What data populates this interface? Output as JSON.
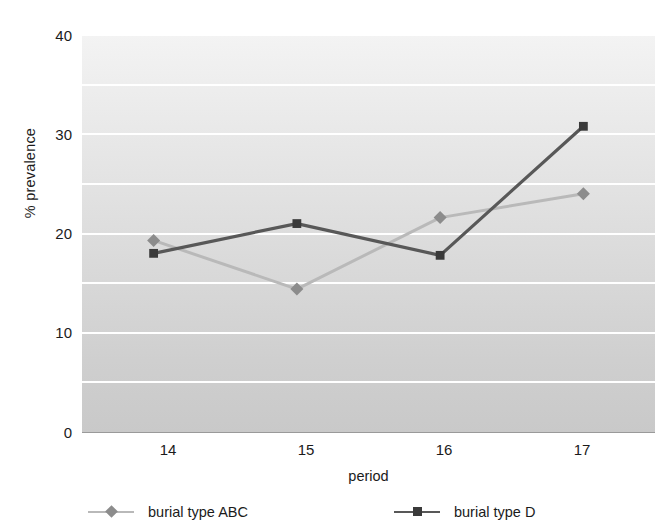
{
  "chart_data": {
    "type": "line",
    "title": "",
    "xlabel": "period",
    "ylabel": "% prevalence",
    "categories": [
      "14",
      "15",
      "16",
      "17"
    ],
    "x": [
      14,
      15,
      16,
      17
    ],
    "xlim": [
      13.5,
      17.5
    ],
    "ylim": [
      0,
      40
    ],
    "yticks": [
      0,
      10,
      20,
      30,
      40
    ],
    "ytick_labels": [
      "0",
      "10",
      "20",
      "30",
      "40"
    ],
    "gridlines_minor": [
      5,
      15,
      25,
      35
    ],
    "grid": true,
    "grid_color": "#ffffff",
    "legend_position": "below-axis",
    "plot_background": "gradient light-gray top to medium-gray bottom",
    "series": [
      {
        "name": "burial type ABC",
        "values": [
          19.3,
          14.4,
          21.6,
          24.0
        ],
        "color": "#b9b9b9",
        "marker": "diamond",
        "marker_color": "#8c8c8c"
      },
      {
        "name": "burial type D",
        "values": [
          18.0,
          21.0,
          17.8,
          30.8
        ],
        "color": "#585858",
        "marker": "square",
        "marker_color": "#3a3a3a"
      }
    ]
  },
  "axes": {
    "y_label": "% prevalence",
    "x_label": "period",
    "y_tick_0": "0",
    "y_tick_1": "10",
    "y_tick_2": "20",
    "y_tick_3": "30",
    "y_tick_4": "40",
    "x_tick_0": "14",
    "x_tick_1": "15",
    "x_tick_2": "16",
    "x_tick_3": "17"
  },
  "legend": {
    "items": [
      {
        "label": "burial type ABC",
        "line_color": "#b9b9b9",
        "marker_color": "#8c8c8c",
        "marker": "diamond"
      },
      {
        "label": "burial type D",
        "line_color": "#585858",
        "marker_color": "#3a3a3a",
        "marker": "square"
      }
    ]
  }
}
